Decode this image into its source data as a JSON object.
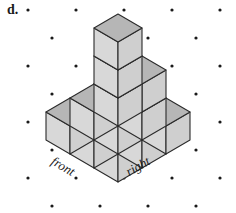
{
  "figure": {
    "item_label": "d.",
    "front_label": "front",
    "right_label": "right",
    "background_color": "#ffffff",
    "dot_color": "#1a1a1a",
    "edge_color": "#2b2b2b",
    "top_face_color": "#b6b6b6",
    "left_face_color": "#d8d8d8",
    "right_face_color": "#cfcfcf"
  },
  "grid": {
    "description": "isometric dot lattice",
    "x_spacing": 48,
    "y_spacing": 28,
    "row_offset_x": 24,
    "row_offset_y": 14,
    "origin_x": 28,
    "origin_y": 10,
    "columns": 5,
    "rows": 8,
    "dot_radius": 1.6
  },
  "geometry": {
    "unit_half_width": 24,
    "unit_half_height": 14,
    "unit_vertical": 28,
    "origin_x": 118,
    "origin_y": 182,
    "cubes": [
      {
        "x": 0,
        "y": 0,
        "z": 0
      },
      {
        "x": 1,
        "y": 0,
        "z": 0
      },
      {
        "x": 2,
        "y": 0,
        "z": 0
      },
      {
        "x": 0,
        "y": 1,
        "z": 0
      },
      {
        "x": 1,
        "y": 1,
        "z": 0
      },
      {
        "x": 2,
        "y": 1,
        "z": 0
      },
      {
        "x": 1,
        "y": 1,
        "z": 1
      },
      {
        "x": 2,
        "y": 1,
        "z": 1
      },
      {
        "x": 0,
        "y": 2,
        "z": 0
      },
      {
        "x": 1,
        "y": 2,
        "z": 0
      },
      {
        "x": 2,
        "y": 2,
        "z": 0
      },
      {
        "x": 2,
        "y": 2,
        "z": 1
      },
      {
        "x": 2,
        "y": 2,
        "z": 2
      }
    ],
    "cube_count": 13
  }
}
